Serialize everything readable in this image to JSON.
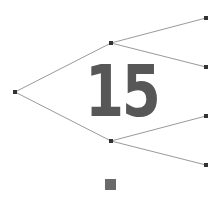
{
  "diagram": {
    "label": "15",
    "colors": {
      "edge": "#9a9a9a",
      "node": "#333333",
      "label": "#575757",
      "square": "#6a6a6a"
    },
    "nodes": [
      {
        "id": "root",
        "x": 15,
        "y": 92
      },
      {
        "id": "mid-top",
        "x": 111,
        "y": 43
      },
      {
        "id": "mid-bottom",
        "x": 111,
        "y": 141
      },
      {
        "id": "leaf-1",
        "x": 206,
        "y": 18
      },
      {
        "id": "leaf-2",
        "x": 206,
        "y": 67
      },
      {
        "id": "leaf-3",
        "x": 206,
        "y": 116
      },
      {
        "id": "leaf-4",
        "x": 206,
        "y": 165
      }
    ],
    "edges": [
      [
        "root",
        "mid-top"
      ],
      [
        "root",
        "mid-bottom"
      ],
      [
        "mid-top",
        "leaf-1"
      ],
      [
        "mid-top",
        "leaf-2"
      ],
      [
        "mid-bottom",
        "leaf-3"
      ],
      [
        "mid-bottom",
        "leaf-4"
      ]
    ]
  }
}
